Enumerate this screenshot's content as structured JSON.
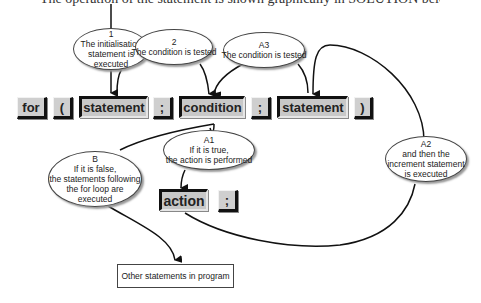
{
  "caption": "The operation of the statement is shown graphically in SOLUTION below.",
  "tokens": {
    "for": "for",
    "open_paren": "(",
    "init_statement": "statement",
    "semicolon1": ";",
    "condition": "condition",
    "semicolon2": ";",
    "increment_statement": "statement",
    "close_paren": ")",
    "action": "action",
    "action_semicolon": ";"
  },
  "ellipses": {
    "step1": {
      "label": "1",
      "lines": [
        "The initialisation",
        "statement is",
        "executed"
      ]
    },
    "step2": {
      "label": "2",
      "lines": [
        "The condition is tested"
      ]
    },
    "stepA3": {
      "label": "A3",
      "lines": [
        "The condition is tested"
      ]
    },
    "stepA1": {
      "label": "A1",
      "lines": [
        "If it is true,",
        "the action is performed"
      ]
    },
    "stepA2": {
      "label": "A2",
      "lines": [
        "and then the",
        "increment statement",
        "is executed"
      ]
    },
    "stepB": {
      "label": "B",
      "lines": [
        "If it is false,",
        "the statements following",
        "the for  loop are",
        "executed"
      ]
    }
  },
  "other_box": "Other statements in program",
  "colors": {
    "token_fill": "#c8c8c8",
    "line": "#111111",
    "background": "#ffffff"
  }
}
